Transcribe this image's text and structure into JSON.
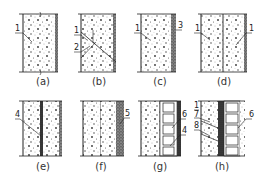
{
  "figure": {
    "colors": {
      "line": "#222222",
      "background": "#ffffff",
      "dense_fill": "#333333"
    },
    "panels": [
      {
        "id": "a",
        "caption": "(a)",
        "callouts": [
          "1"
        ]
      },
      {
        "id": "b",
        "caption": "(b)",
        "callouts": [
          "1",
          "2"
        ]
      },
      {
        "id": "c",
        "caption": "(c)",
        "callouts": [
          "1",
          "3"
        ]
      },
      {
        "id": "d",
        "caption": "(d)",
        "callouts": [
          "1",
          "1"
        ]
      },
      {
        "id": "e",
        "caption": "(e)",
        "callouts": [
          "4"
        ]
      },
      {
        "id": "f",
        "caption": "(f)",
        "callouts": [
          "5"
        ]
      },
      {
        "id": "g",
        "caption": "(g)",
        "callouts": [
          "6",
          "4"
        ]
      },
      {
        "id": "h",
        "caption": "(h)",
        "callouts": [
          "1",
          "7",
          "8",
          "6"
        ]
      }
    ]
  }
}
